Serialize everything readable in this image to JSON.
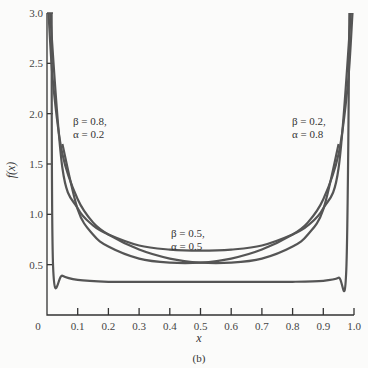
{
  "chart_data": {
    "type": "line",
    "title": "",
    "caption": "(b)",
    "xlabel": "x",
    "ylabel": "f(x)",
    "xlim": [
      0,
      1.0
    ],
    "ylim": [
      0,
      3.0
    ],
    "grid": false,
    "x_ticks": [
      "0",
      "0.1",
      "0.2",
      "0.3",
      "0.4",
      "0.5",
      "0.6",
      "0.7",
      "0.8",
      "0.9",
      "1.0"
    ],
    "y_ticks": [
      "0.5",
      "1.0",
      "1.5",
      "2.0",
      "2.5",
      "3.0"
    ],
    "series": [
      {
        "name": "β = 0.8, α = 0.2",
        "x": [
          0.005,
          0.02,
          0.05,
          0.1,
          0.15,
          0.2,
          0.3,
          0.4,
          0.5,
          0.6,
          0.7,
          0.8,
          0.85,
          0.9,
          0.95
        ],
        "y": [
          3.0,
          2.3,
          1.6,
          1.15,
          0.92,
          0.8,
          0.65,
          0.56,
          0.52,
          0.52,
          0.56,
          0.68,
          0.8,
          1.05,
          1.7
        ]
      },
      {
        "name": "β = 0.5, α = 0.5",
        "x": [
          0.01,
          0.05,
          0.1,
          0.15,
          0.2,
          0.3,
          0.4,
          0.5,
          0.6,
          0.7,
          0.8,
          0.85,
          0.9,
          0.95,
          0.99
        ],
        "y": [
          3.2,
          1.46,
          1.06,
          0.89,
          0.8,
          0.69,
          0.65,
          0.64,
          0.65,
          0.69,
          0.8,
          0.89,
          1.06,
          1.46,
          3.2
        ]
      },
      {
        "name": "β = 0.2, α = 0.8",
        "x": [
          0.05,
          0.1,
          0.15,
          0.2,
          0.3,
          0.4,
          0.5,
          0.6,
          0.7,
          0.8,
          0.85,
          0.9,
          0.95,
          0.98,
          0.995
        ],
        "y": [
          1.7,
          1.05,
          0.8,
          0.68,
          0.56,
          0.52,
          0.52,
          0.56,
          0.65,
          0.8,
          0.92,
          1.15,
          1.6,
          2.3,
          3.0
        ]
      },
      {
        "name": "near-uniform (unlabeled)",
        "x": [
          0.015,
          0.02,
          0.05,
          0.1,
          0.2,
          0.3,
          0.5,
          0.7,
          0.8,
          0.9,
          0.95,
          0.975,
          0.985
        ],
        "y": [
          3.0,
          0.48,
          0.39,
          0.35,
          0.33,
          0.33,
          0.33,
          0.33,
          0.33,
          0.34,
          0.37,
          0.45,
          3.0
        ]
      }
    ],
    "annotations": [
      {
        "text": "β = 0.8,",
        "text2": "α = 0.2",
        "x": 0.1,
        "y": 2.0
      },
      {
        "text": "β = 0.5,",
        "text2": "α = 0.5",
        "x": 0.5,
        "y": 0.8
      },
      {
        "text": "β = 0.2,",
        "text2": "α = 0.8",
        "x": 0.82,
        "y": 2.0
      }
    ]
  }
}
